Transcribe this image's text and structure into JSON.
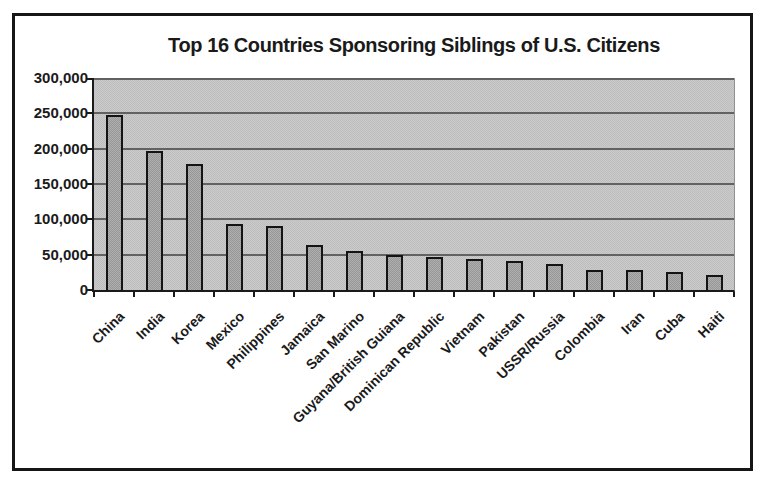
{
  "chart_data": {
    "type": "bar",
    "title": "Top 16 Countries Sponsoring Siblings of U.S. Citizens",
    "categories": [
      "China",
      "India",
      "Korea",
      "Mexico",
      "Philippines",
      "Jamaica",
      "San Marino",
      "Guyana/British Guiana",
      "Dominican Republic",
      "Vietnam",
      "Pakistan",
      "USSR/Russia",
      "Colombia",
      "Iran",
      "Cuba",
      "Haiti"
    ],
    "values": [
      248000,
      196000,
      178000,
      93000,
      91000,
      64000,
      55000,
      50000,
      47000,
      44000,
      41000,
      37000,
      29000,
      28000,
      25000,
      21000
    ],
    "xlabel": "",
    "ylabel": "",
    "ylim": [
      0,
      300000
    ],
    "ytick_values": [
      0,
      50000,
      100000,
      150000,
      200000,
      250000,
      300000
    ],
    "ytick_labels": [
      "0",
      "50,000",
      "100,000",
      "150,000",
      "200,000",
      "250,000",
      "300,000"
    ],
    "grid": true,
    "legend": false,
    "x_label_rotation_deg": 45
  },
  "colors": {
    "page_bg": "#ffffff",
    "frame_border": "#161616",
    "plot_bg": "#cbcbcb",
    "plot_bg_alt": "#bdbdbd",
    "bar_fill": "#aeaeae",
    "bar_fill_alt": "#989898",
    "bar_border": "#141414",
    "gridline": "#4c4c4c",
    "axis": "#1a1a1a",
    "text": "#1a1a1a"
  }
}
